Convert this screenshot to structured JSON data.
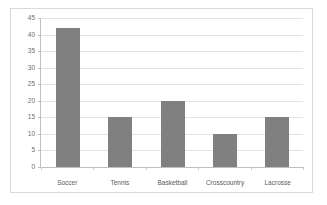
{
  "chart_data": {
    "type": "bar",
    "title": "",
    "subtitle": "",
    "xlabel": "",
    "ylabel": "",
    "categories": [
      "Soccer",
      "Tennis",
      "Basketball",
      "Crosscountry",
      "Lacrosse"
    ],
    "values": [
      42,
      15,
      20,
      10,
      15
    ],
    "ylim": [
      0,
      45
    ],
    "ytick_step": 5,
    "yticks": [
      0,
      5,
      10,
      15,
      20,
      25,
      30,
      35,
      40,
      45
    ],
    "ytick_labels": [
      "0",
      "5",
      "10",
      "15",
      "20",
      "25",
      "30",
      "35",
      "40",
      "45"
    ],
    "grid": "horizontal",
    "legend": "none",
    "series": [
      {
        "name": "",
        "values": [
          42,
          15,
          20,
          10,
          15
        ],
        "color": "#808080"
      }
    ]
  },
  "style": {
    "bar_color": "#808080",
    "gridline_color": "#e4e4e4",
    "axis_color": "#bfbfbf",
    "border_color": "#d9d9d9",
    "tick_label_color": "#6d6d6d",
    "category_label_color": "#595959",
    "plot_background": "#ffffff"
  }
}
